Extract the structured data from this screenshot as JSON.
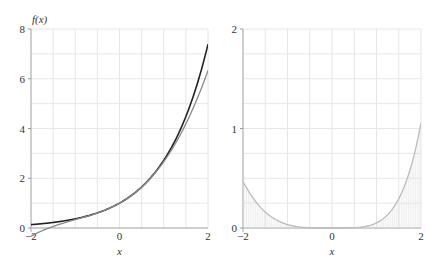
{
  "chart_data": [
    {
      "type": "line",
      "title": "",
      "xlabel": "x",
      "ylabel": "f(x)",
      "xlim": [
        -2,
        2
      ],
      "ylim": [
        0,
        8
      ],
      "grid": true,
      "xticks": [
        "-2",
        "0",
        "2"
      ],
      "yticks": [
        "0",
        "2",
        "4",
        "6",
        "8"
      ],
      "series": [
        {
          "name": "exp(x)",
          "color": "#222222",
          "x": [
            -2,
            -1.5,
            -1,
            -0.5,
            0,
            0.5,
            1,
            1.5,
            2
          ],
          "values": [
            0.135,
            0.223,
            0.368,
            0.607,
            1.0,
            1.649,
            2.718,
            4.482,
            7.389
          ]
        },
        {
          "name": "cubic Taylor polynomial",
          "color": "#888888",
          "x": [
            -2,
            -1.5,
            -1,
            -0.5,
            0,
            0.5,
            1,
            1.5,
            2
          ],
          "values": [
            -0.333,
            0.063,
            0.333,
            0.604,
            1.0,
            1.646,
            2.667,
            4.188,
            6.333
          ]
        }
      ]
    },
    {
      "type": "area",
      "title": "",
      "xlabel": "x",
      "ylabel": "",
      "xlim": [
        -2,
        2
      ],
      "ylim": [
        0,
        2
      ],
      "grid": true,
      "xticks": [
        "-2",
        "0",
        "2"
      ],
      "yticks": [
        "0",
        "1",
        "2"
      ],
      "series": [
        {
          "name": "error |exp(x) - P3(x)|",
          "color": "#bbbbbb",
          "x": [
            -2,
            -1.5,
            -1,
            -0.5,
            0,
            0.5,
            1,
            1.5,
            2
          ],
          "values": [
            0.468,
            0.161,
            0.035,
            0.003,
            0.0,
            0.003,
            0.052,
            0.294,
            1.056
          ]
        }
      ]
    }
  ],
  "labels": {
    "left_ylabel": "f(x)",
    "left_xlabel": "x",
    "right_xlabel": "x",
    "left_xticks": [
      "-2",
      "0",
      "2"
    ],
    "left_yticks": [
      "0",
      "2",
      "4",
      "6",
      "8"
    ],
    "right_xticks": [
      "-2",
      "0",
      "2"
    ],
    "right_yticks": [
      "0",
      "1",
      "2"
    ]
  }
}
